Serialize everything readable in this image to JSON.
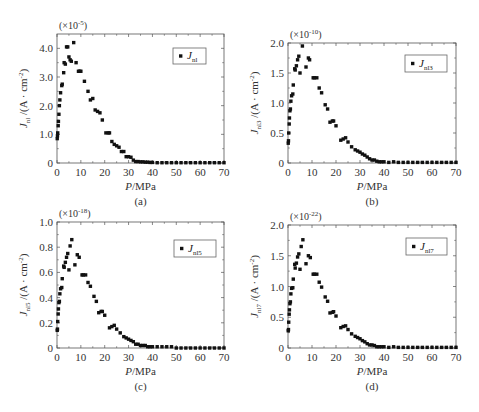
{
  "chart_data": [
    {
      "type": "scatter",
      "panel_label": "(a)",
      "multiplier": "(×10⁻⁵)",
      "multiplier_base": "(×10",
      "multiplier_exp": "-5",
      "xlabel": "P/MPa",
      "ylabel": "J_nl /(A·cm⁻²)",
      "ylabel_sub": "nl",
      "legend": [
        {
          "marker": "square",
          "label": "J_nl",
          "sub": "nl"
        }
      ],
      "xlim": [
        0,
        70
      ],
      "ylim": [
        0,
        4.5
      ],
      "xticks": [
        0,
        10,
        20,
        30,
        40,
        50,
        60,
        70
      ],
      "yticks": [
        0,
        1.0,
        2.0,
        3.0,
        4.0
      ],
      "ytick_labels": [
        "0",
        "1.0",
        "2.0",
        "3.0",
        "4.0"
      ],
      "grid": false,
      "legend_position": "upper right",
      "x": [
        0.1,
        0.2,
        0.3,
        0.5,
        0.6,
        0.8,
        1.0,
        1.2,
        1.5,
        2.0,
        2.2,
        2.8,
        3.0,
        3.5,
        4.0,
        4.5,
        5.0,
        5.5,
        6.0,
        7.0,
        8.0,
        9.0,
        9.5,
        10.0,
        11.5,
        13.0,
        14.0,
        15.0,
        16.0,
        17.0,
        18.0,
        19.0,
        20.5,
        21.5,
        22.0,
        23.0,
        24.0,
        25.0,
        26.0,
        27.0,
        28.0,
        29.0,
        30.0,
        31.0,
        32.0,
        33.0,
        34.0,
        35.0,
        36.0,
        37.0,
        38.0,
        39.0,
        40.0,
        42,
        44,
        46,
        48,
        50,
        52,
        54,
        56,
        58,
        60,
        62,
        64,
        66,
        68,
        70
      ],
      "values": [
        0.85,
        0.95,
        1.05,
        1.3,
        1.45,
        1.7,
        2.0,
        2.2,
        2.45,
        2.7,
        2.75,
        3.15,
        3.5,
        3.45,
        4.05,
        4.05,
        3.7,
        3.6,
        3.55,
        4.2,
        3.5,
        3.2,
        3.2,
        3.2,
        2.85,
        2.5,
        2.2,
        2.25,
        1.85,
        1.8,
        1.75,
        1.5,
        1.05,
        1.05,
        1.05,
        0.75,
        0.65,
        0.6,
        0.55,
        0.4,
        0.4,
        0.22,
        0.22,
        0.2,
        0.1,
        0.05,
        0.05,
        0.04,
        0.04,
        0.03,
        0.03,
        0.02,
        0.02,
        0.01,
        0.01,
        0.01,
        0.01,
        0.01,
        0.01,
        0.01,
        0.01,
        0.01,
        0.01,
        0.01,
        0.01,
        0.01,
        0.01,
        0.01
      ]
    },
    {
      "type": "scatter",
      "panel_label": "(b)",
      "multiplier": "(×10⁻¹⁰)",
      "multiplier_base": "(×10",
      "multiplier_exp": "-10",
      "xlabel": "P/MPa",
      "ylabel": "J_nl3 /(A·cm⁻²)",
      "ylabel_sub": "nl3",
      "legend": [
        {
          "marker": "square",
          "label": "J_nl3",
          "sub": "nl3"
        }
      ],
      "xlim": [
        0,
        70
      ],
      "ylim": [
        0,
        2.0
      ],
      "xticks": [
        0,
        10,
        20,
        30,
        40,
        50,
        60,
        70
      ],
      "yticks": [
        0,
        0.5,
        1.0,
        1.5,
        2.0
      ],
      "ytick_labels": [
        "0",
        "0.5",
        "1.0",
        "1.5",
        "2.0"
      ],
      "grid": false,
      "legend_position": "upper right",
      "x": [
        0.1,
        0.2,
        0.3,
        0.5,
        0.6,
        0.8,
        1.0,
        1.2,
        1.5,
        2.0,
        2.2,
        2.8,
        3.0,
        3.5,
        4.0,
        4.5,
        5.0,
        6.0,
        7.5,
        8.5,
        9.0,
        10.5,
        11.0,
        12.0,
        13.0,
        14.0,
        15.5,
        16.5,
        17.5,
        18.5,
        19.0,
        20.0,
        22.0,
        23.0,
        24.0,
        25.0,
        26.5,
        28.0,
        29.0,
        30.0,
        31.0,
        32.0,
        33.0,
        34.0,
        35.0,
        36.0,
        37.0,
        38.0,
        39.0,
        40.0,
        42,
        44,
        46,
        48,
        50,
        52,
        54,
        56,
        58,
        60,
        62,
        64,
        66,
        68,
        70
      ],
      "values": [
        0.33,
        0.37,
        0.5,
        0.65,
        0.75,
        0.87,
        0.9,
        1.03,
        1.12,
        1.15,
        1.3,
        1.57,
        1.55,
        1.62,
        1.72,
        1.78,
        1.5,
        1.95,
        1.6,
        1.75,
        1.72,
        1.42,
        1.42,
        1.42,
        1.25,
        1.17,
        0.97,
        0.9,
        0.68,
        0.7,
        0.7,
        0.62,
        0.38,
        0.4,
        0.42,
        0.35,
        0.27,
        0.22,
        0.2,
        0.18,
        0.15,
        0.13,
        0.1,
        0.07,
        0.05,
        0.05,
        0.03,
        0.02,
        0.02,
        0.02,
        0.01,
        0.02,
        0.01,
        0.01,
        0.01,
        0.01,
        0.01,
        0.01,
        0.01,
        0.01,
        0.01,
        0.01,
        0.01,
        0.01,
        0.01
      ]
    },
    {
      "type": "scatter",
      "panel_label": "(c)",
      "multiplier": "(×10⁻¹⁸)",
      "multiplier_base": "(×10",
      "multiplier_exp": "-18",
      "xlabel": "P/MPa",
      "ylabel": "J_nl5 /(A·cm⁻²)",
      "ylabel_sub": "nl5",
      "legend": [
        {
          "marker": "square",
          "label": "J_nl5",
          "sub": "nl5"
        }
      ],
      "xlim": [
        0,
        70
      ],
      "ylim": [
        0,
        1.0
      ],
      "xticks": [
        0,
        10,
        20,
        30,
        40,
        50,
        60,
        70
      ],
      "yticks": [
        0,
        0.2,
        0.4,
        0.6,
        0.8,
        1.0
      ],
      "ytick_labels": [
        "0",
        "0.2",
        "0.4",
        "0.6",
        "0.8",
        "1.0"
      ],
      "grid": false,
      "legend_position": "upper right",
      "x": [
        0.1,
        0.2,
        0.3,
        0.5,
        0.6,
        0.8,
        1.0,
        1.2,
        1.5,
        2.0,
        2.2,
        2.8,
        3.0,
        3.5,
        4.0,
        4.5,
        5.0,
        5.5,
        6.2,
        7.5,
        8.5,
        9.3,
        10.5,
        11.0,
        12.0,
        13.0,
        14.0,
        15.5,
        16.5,
        17.5,
        18.5,
        19.0,
        20.0,
        22.0,
        23.0,
        24.0,
        25.0,
        26.5,
        28.0,
        29.0,
        30.0,
        31.0,
        32.0,
        33.0,
        34.0,
        35.0,
        36.0,
        37.0,
        38.0,
        39.0,
        40.0,
        42,
        44,
        46,
        48,
        50,
        52,
        54,
        56,
        58,
        60,
        62,
        64,
        66,
        68,
        70
      ],
      "values": [
        0.14,
        0.15,
        0.21,
        0.27,
        0.31,
        0.36,
        0.37,
        0.43,
        0.47,
        0.48,
        0.55,
        0.65,
        0.64,
        0.68,
        0.72,
        0.75,
        0.62,
        0.81,
        0.86,
        0.66,
        0.74,
        0.72,
        0.58,
        0.58,
        0.58,
        0.52,
        0.49,
        0.41,
        0.37,
        0.28,
        0.29,
        0.29,
        0.26,
        0.16,
        0.17,
        0.18,
        0.15,
        0.12,
        0.09,
        0.08,
        0.07,
        0.06,
        0.05,
        0.03,
        0.03,
        0.02,
        0.02,
        0.02,
        0.01,
        0.01,
        0.01,
        0.01,
        0.01,
        0.01,
        0.01,
        0.0,
        0.0,
        0.0,
        0.0,
        0.0,
        0.0,
        0.0,
        0.0,
        0.0,
        0.0,
        0.0
      ]
    },
    {
      "type": "scatter",
      "panel_label": "(d)",
      "multiplier": "(×10⁻²²)",
      "multiplier_base": "(×10",
      "multiplier_exp": "-22",
      "xlabel": "P/MPa",
      "ylabel": "J_nl7 /(A·cm⁻²)",
      "ylabel_sub": "nl7",
      "legend": [
        {
          "marker": "square",
          "label": "J_nl7",
          "sub": "nl7"
        }
      ],
      "xlim": [
        0,
        70
      ],
      "ylim": [
        0,
        2.0
      ],
      "xticks": [
        0,
        10,
        20,
        30,
        40,
        50,
        60,
        70
      ],
      "yticks": [
        0,
        0.5,
        1.0,
        1.5,
        2.0
      ],
      "ytick_labels": [
        "0",
        "0.5",
        "1.0",
        "1.5",
        "2.0"
      ],
      "grid": false,
      "legend_position": "upper right",
      "x": [
        0.1,
        0.2,
        0.3,
        0.5,
        0.6,
        0.8,
        1.0,
        1.2,
        1.5,
        2.0,
        2.2,
        2.8,
        3.0,
        3.5,
        4.0,
        4.5,
        5.0,
        5.5,
        6.2,
        7.5,
        8.5,
        9.3,
        10.5,
        11.0,
        12.0,
        13.0,
        14.0,
        15.5,
        16.5,
        17.5,
        18.5,
        19.0,
        20.0,
        22.0,
        23.0,
        24.0,
        25.0,
        26.5,
        28.0,
        29.0,
        30.0,
        31.0,
        32.0,
        33.0,
        34.0,
        35.0,
        36.0,
        37.0,
        38.0,
        39.0,
        40.0,
        42,
        44,
        46,
        48,
        50,
        52,
        54,
        56,
        58,
        60,
        62,
        64,
        66,
        68,
        70
      ],
      "values": [
        0.28,
        0.3,
        0.42,
        0.55,
        0.62,
        0.72,
        0.75,
        0.88,
        0.97,
        0.98,
        1.12,
        1.36,
        1.3,
        1.38,
        1.48,
        1.53,
        1.28,
        1.65,
        1.76,
        1.37,
        1.5,
        1.47,
        1.2,
        1.2,
        1.2,
        1.07,
        0.99,
        0.83,
        0.76,
        0.57,
        0.58,
        0.59,
        0.52,
        0.33,
        0.35,
        0.36,
        0.3,
        0.23,
        0.19,
        0.17,
        0.15,
        0.12,
        0.1,
        0.07,
        0.05,
        0.05,
        0.04,
        0.02,
        0.02,
        0.02,
        0.02,
        0.01,
        0.02,
        0.01,
        0.01,
        0.01,
        0.01,
        0.01,
        0.01,
        0.01,
        0.01,
        0.01,
        0.01,
        0.01,
        0.01,
        0.01
      ]
    }
  ],
  "ylabel_suffix": "/(A · cm",
  "ylabel_exp": "-2",
  "ylabel_close": ")",
  "legend_symbol": "J",
  "ylabel_symbol": "J"
}
